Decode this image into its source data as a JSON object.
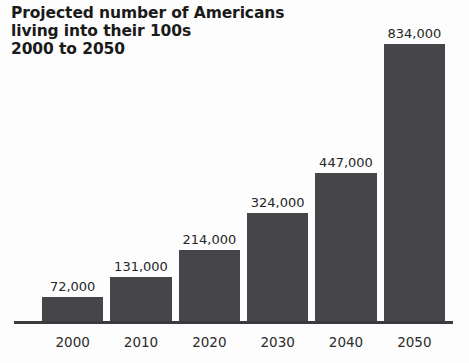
{
  "title": {
    "line1": "Projected number of Americans",
    "line2": "living into their 100s",
    "line3": "2000 to 2050"
  },
  "colors": {
    "bar": "#46464a",
    "axis": "#3b3b3f",
    "title_text": "#1a1a1a",
    "label_text": "#262626",
    "background": "#fdfdfd"
  },
  "chart_data": {
    "type": "bar",
    "title": "Projected number of Americans living into their 100s 2000 to 2050",
    "subtitle": "2000 to 2050",
    "xlabel": "",
    "ylabel": "",
    "categories": [
      "2000",
      "2010",
      "2020",
      "2030",
      "2040",
      "2050"
    ],
    "values": [
      72000,
      131000,
      214000,
      324000,
      447000,
      834000
    ],
    "value_labels": [
      "72,000",
      "131,000",
      "214,000",
      "324,000",
      "447,000",
      "834,000"
    ],
    "ylim": [
      0,
      900000
    ],
    "grid": false,
    "legend": false,
    "orientation": "vertical"
  }
}
